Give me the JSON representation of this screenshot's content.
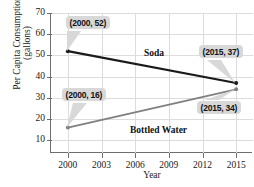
{
  "chart_data": {
    "type": "line",
    "title": "Soda and Bottled Water",
    "xlabel": "Year",
    "ylabel_line1": "Per Capita Consumption",
    "ylabel_line2": "(gallons)",
    "x": [
      2000,
      2015
    ],
    "xticks": [
      "2000",
      "2003",
      "2006",
      "2009",
      "2012",
      "2015"
    ],
    "xtick_values": [
      2000,
      2003,
      2006,
      2009,
      2012,
      2015
    ],
    "yticks": [
      "10",
      "20",
      "30",
      "40",
      "50",
      "60",
      "70"
    ],
    "ytick_values": [
      10,
      20,
      30,
      40,
      50,
      60,
      70
    ],
    "xlim": [
      1998.5,
      2016.5
    ],
    "ylim": [
      4,
      70
    ],
    "grid": true,
    "legend": "inline-labels",
    "series": [
      {
        "name": "Soda",
        "color": "#1a1a1a",
        "values": [
          52,
          37
        ],
        "points": [
          [
            2000,
            52
          ],
          [
            2015,
            37
          ]
        ]
      },
      {
        "name": "Bottled Water",
        "color": "#808080",
        "values": [
          16,
          34
        ],
        "points": [
          [
            2000,
            16
          ],
          [
            2015,
            34
          ]
        ]
      }
    ],
    "annotations": [
      {
        "text": "(2000, 52)",
        "point": [
          2000,
          52
        ],
        "series": "Soda"
      },
      {
        "text": "(2015, 37)",
        "point": [
          2015,
          37
        ],
        "series": "Soda"
      },
      {
        "text": "(2000, 16)",
        "point": [
          2000,
          16
        ],
        "series": "Bottled Water"
      },
      {
        "text": "(2015, 34)",
        "point": [
          2015,
          34
        ],
        "series": "Bottled Water"
      }
    ]
  }
}
